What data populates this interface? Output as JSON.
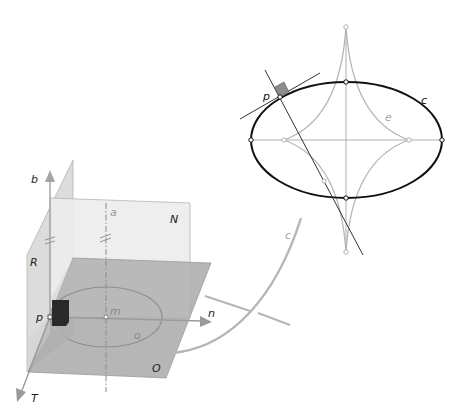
{
  "figure": {
    "left_panel": {
      "description": "Frenet frame at point p on space curve c with osculating, normal and rectifying planes",
      "labels": {
        "binormal_axis": "b",
        "principal_normal_axis": "n",
        "tangent_axis": "T",
        "point": "p",
        "center_of_curvature": "m",
        "osculating_circle": "o",
        "axis_of_curvature": "a",
        "normal_plane": "N",
        "rectifying_plane": "R",
        "osculating_plane": "O",
        "curve": "c"
      }
    },
    "right_panel": {
      "description": "Ellipse c with its evolute e, normal and tangent at point p",
      "labels": {
        "point": "p",
        "ellipse": "c",
        "evolute": "e"
      }
    },
    "colors": {
      "black_curve": "#1a1a1a",
      "gray_curve": "#b0b0b0",
      "plane_light": "#e6e6e6",
      "plane_mid": "#d8d8d8",
      "plane_dark": "#a8a8a8",
      "axis_gray": "#9a9a9a",
      "label_gray": "#a0a0a0",
      "square_gray": "#8c8c8c",
      "square_dark": "#2a2a2a"
    }
  }
}
